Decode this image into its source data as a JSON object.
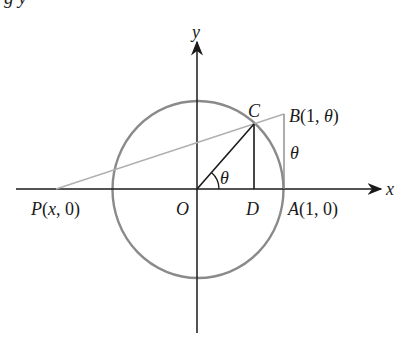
{
  "top_cut_text": "g         y",
  "diagram": {
    "axes": {
      "x_label": "x",
      "y_label": "y"
    },
    "points": {
      "origin": "O",
      "C": "C",
      "D": "D",
      "A": "A(1, 0)",
      "B": "B(1, θ)",
      "P": "P(x, 0)"
    },
    "angle_label": "θ",
    "segment_label": "θ",
    "colors": {
      "axis": "#1a1a1a",
      "circle": "#8a8a8a",
      "secant": "#b0b0b0",
      "segment": "#222222"
    }
  }
}
